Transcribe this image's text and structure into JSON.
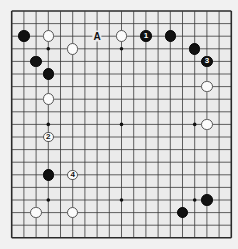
{
  "board": {
    "size": 19,
    "origin_x": 11.7,
    "origin_y": 11.0,
    "spacing_x": 12.2,
    "spacing_y": 12.6,
    "colors": {
      "page_bg": "#f1f1f1",
      "board_bg": "#ebebeb",
      "line": "#3a3a3a",
      "edge": "#2a2a2a",
      "black": "#111111",
      "white": "#fbfbfb"
    },
    "star_points": [
      [
        3,
        3
      ],
      [
        9,
        3
      ],
      [
        15,
        3
      ],
      [
        3,
        9
      ],
      [
        9,
        9
      ],
      [
        15,
        9
      ],
      [
        3,
        15
      ],
      [
        9,
        15
      ],
      [
        15,
        15
      ]
    ]
  },
  "stones": [
    {
      "color": "black",
      "col": 1,
      "row": 2,
      "label": ""
    },
    {
      "color": "white",
      "col": 3,
      "row": 2,
      "label": ""
    },
    {
      "color": "white",
      "col": 9,
      "row": 2,
      "label": ""
    },
    {
      "color": "black",
      "col": 11,
      "row": 2,
      "label": "1"
    },
    {
      "color": "black",
      "col": 13,
      "row": 2,
      "label": ""
    },
    {
      "color": "white",
      "col": 5,
      "row": 3,
      "label": ""
    },
    {
      "color": "black",
      "col": 15,
      "row": 3,
      "label": ""
    },
    {
      "color": "black",
      "col": 2,
      "row": 4,
      "label": ""
    },
    {
      "color": "black",
      "col": 16,
      "row": 4,
      "label": "3"
    },
    {
      "color": "black",
      "col": 3,
      "row": 5,
      "label": ""
    },
    {
      "color": "white",
      "col": 16,
      "row": 6,
      "label": ""
    },
    {
      "color": "white",
      "col": 3,
      "row": 7,
      "label": ""
    },
    {
      "color": "white",
      "col": 16,
      "row": 9,
      "label": ""
    },
    {
      "color": "white",
      "col": 3,
      "row": 10,
      "label": "2"
    },
    {
      "color": "black",
      "col": 3,
      "row": 13,
      "label": ""
    },
    {
      "color": "white",
      "col": 5,
      "row": 13,
      "label": "4"
    },
    {
      "color": "black",
      "col": 16,
      "row": 15,
      "label": ""
    },
    {
      "color": "white",
      "col": 2,
      "row": 16,
      "label": ""
    },
    {
      "color": "white",
      "col": 5,
      "row": 16,
      "label": ""
    },
    {
      "color": "black",
      "col": 14,
      "row": 16,
      "label": ""
    }
  ],
  "markers": [
    {
      "text": "A",
      "col": 7,
      "row": 2
    }
  ]
}
